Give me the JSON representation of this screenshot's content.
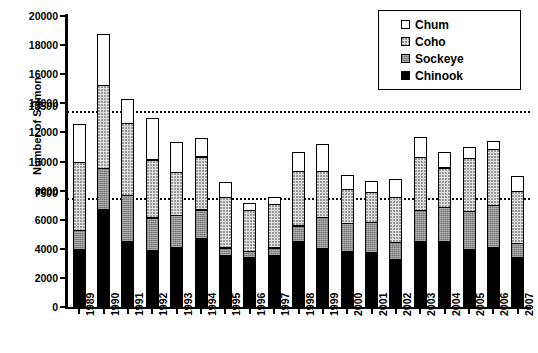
{
  "chart_data": {
    "type": "bar",
    "stacked": true,
    "title": "",
    "xlabel": "",
    "ylabel": "Number of Salmon",
    "ylim": [
      0,
      20000
    ],
    "ytick_step": 2000,
    "yticks": [
      "0",
      "2000",
      "4000",
      "6000",
      "8000",
      "10000",
      "12000",
      "14000",
      "16000",
      "18000",
      "20000"
    ],
    "grid": false,
    "legend_position": "top-right",
    "categories": [
      "1989",
      "1990",
      "1991",
      "1992",
      "1993",
      "1994",
      "1995",
      "1996",
      "1997",
      "1998",
      "1999",
      "2000",
      "2001",
      "2002",
      "2003",
      "2004",
      "2005",
      "2006",
      "2007"
    ],
    "series": [
      {
        "name": "Chinook",
        "color": "#000000",
        "pattern": "solid",
        "values": [
          4000,
          6800,
          4550,
          3950,
          4150,
          4750,
          3600,
          3450,
          3600,
          4600,
          4100,
          3900,
          3800,
          3350,
          4550,
          4600,
          4000,
          4150,
          3500
        ]
      },
      {
        "name": "Sockeye",
        "color": "#8f8f8f",
        "pattern": "fine-grid-gray",
        "values": [
          1400,
          2850,
          3250,
          2300,
          2300,
          2050,
          600,
          500,
          600,
          1100,
          2200,
          2000,
          2150,
          1200,
          2200,
          2400,
          2700,
          2950,
          1000
        ]
      },
      {
        "name": "Coho",
        "color": "#e2e2e2",
        "pattern": "dense-dots",
        "values": [
          4700,
          5750,
          5000,
          4050,
          3000,
          3700,
          3500,
          2900,
          3050,
          3800,
          3200,
          2350,
          2100,
          3150,
          3700,
          2750,
          3700,
          3900,
          3650
        ]
      },
      {
        "name": "Chum",
        "color": "#ffffff",
        "pattern": "sparse-dots",
        "values": [
          2700,
          3600,
          1700,
          2900,
          2100,
          1350,
          1100,
          500,
          500,
          1400,
          1900,
          1050,
          800,
          1300,
          1450,
          1150,
          800,
          600,
          1100
        ]
      }
    ],
    "reference_lines": [
      {
        "label": "13500",
        "value": 13500,
        "style": "dotted"
      },
      {
        "label": "7500",
        "value": 7500,
        "style": "dotted"
      }
    ]
  },
  "legend": {
    "items": [
      {
        "label": "Chum",
        "swatch": "chum"
      },
      {
        "label": "Coho",
        "swatch": "coho"
      },
      {
        "label": "Sockeye",
        "swatch": "sockeye"
      },
      {
        "label": "Chinook",
        "swatch": "chinook"
      }
    ]
  }
}
